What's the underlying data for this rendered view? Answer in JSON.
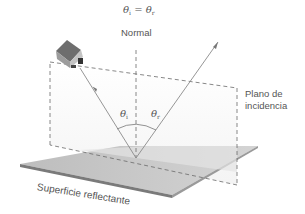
{
  "diagram": {
    "equation": {
      "theta": "θ",
      "sub_i": "i",
      "equals": " = ",
      "sub_r": "r"
    },
    "normal_label": "Normal",
    "plane_label_line1": "Plano de",
    "plane_label_line2": "incidencia",
    "angle_incident": {
      "theta": "θ",
      "sub": "i"
    },
    "angle_reflected": {
      "theta": "θ",
      "sub": "r"
    },
    "surface_label": "Superficie reflectante",
    "colors": {
      "surface_top": "#c8c8c8",
      "surface_edge": "#7a7a7a",
      "plane_fill": "#f2f2f2",
      "rays": "#8a8a8a",
      "dashed": "#6a6a6a",
      "text": "#555555"
    }
  }
}
